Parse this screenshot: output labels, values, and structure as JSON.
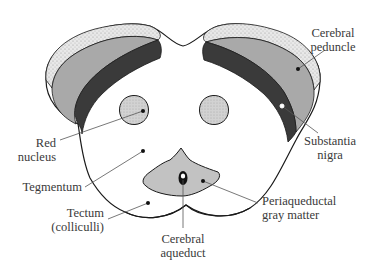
{
  "diagram": {
    "type": "anatomical cross-section",
    "colors": {
      "outline": "#1a1a1a",
      "peduncle_fill": "#a9a9a9",
      "substantia_nigra_fill": "#3a3a3a",
      "border_band_fill": "#e6e6e6",
      "red_nucleus_fill": "#c8c8c8",
      "periaqueductal_fill": "#c2c2c2",
      "aqueduct_fill": "#ffffff",
      "leader_line": "#555555",
      "label_text": "#3a3a3a"
    },
    "labels": {
      "cerebral_peduncle": {
        "line1": "Cerebral",
        "line2": "peduncle"
      },
      "substantia_nigra": {
        "line1": "Substantia",
        "line2": "nigra"
      },
      "red_nucleus": {
        "line1": "Red",
        "line2": "nucleus"
      },
      "tegmentum": {
        "line1": "Tegmentum"
      },
      "periaqueductal_gray": {
        "line1": "Periaqueductal",
        "line2": "gray matter"
      },
      "tectum": {
        "line1": "Tectum",
        "line2": "(colliculli)"
      },
      "cerebral_aqueduct": {
        "line1": "Cerebral",
        "line2": "aqueduct"
      }
    }
  }
}
